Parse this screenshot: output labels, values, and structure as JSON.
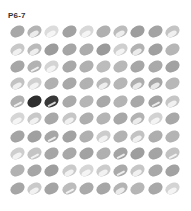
{
  "title": "P6-7",
  "grid": {
    "rows": 10,
    "cols": 10,
    "cells": [
      [
        "#a8a8a8",
        "#b4b4b4",
        "#dcdcdc",
        "#a2a2a2",
        "#d8d8d8",
        "#b0b0b0",
        "#bcbcbc",
        "#9e9e9e",
        "#a4a4a4",
        "#c4c4c4"
      ],
      [
        "#c8c8c8",
        "#bababa",
        "#9c9c9c",
        "#a6a6a6",
        "#acacac",
        "#9a9a9a",
        "#cfcfcf",
        "#b2b2b2",
        "#a0a0a0",
        "#b6b6b6"
      ],
      [
        "#a6a6a6",
        "#b2b2b2",
        "#d4d4d4",
        "#a8a8a8",
        "#b0b0b0",
        "#bcbcbc",
        "#b8b8b8",
        "#a6a6a6",
        "#aaaaaa",
        "#a2a2a2"
      ],
      [
        "#c2c2c2",
        "#d0d0d0",
        "#b0b0b0",
        "#a8a8a8",
        "#b2b2b2",
        "#bababa",
        "#b6b6b6",
        "#aeaeae",
        "#a6a6a6",
        "#b8b8b8"
      ],
      [
        "#b0b0b0",
        "#2e2e2e",
        "#383838",
        "#aaaaaa",
        "#b6b6b6",
        "#a8a8a8",
        "#b4b4b4",
        "#a8a8a8",
        "#a2a2a2",
        "#c6c6c6"
      ],
      [
        "#d6d6d6",
        "#c8c8c8",
        "#a8a8a8",
        "#c6c6c6",
        "#aeaeae",
        "#b4b4b4",
        "#a8a8a8",
        "#b2b2b2",
        "#d2d2d2",
        "#a8a8a8"
      ],
      [
        "#a4a4a4",
        "#a0a0a0",
        "#a6a6a6",
        "#a2a2a2",
        "#b0b0b0",
        "#cccccc",
        "#b2b2b2",
        "#c2c2c2",
        "#aeaeae",
        "#b4b4b4"
      ],
      [
        "#cecece",
        "#c4c4c4",
        "#a6a6a6",
        "#a8a8a8",
        "#a2a2a2",
        "#b0b0b0",
        "#a4a4a4",
        "#9e9e9e",
        "#a4a4a4",
        "#c2c2c2"
      ],
      [
        "#b2b2b2",
        "#a6a6a6",
        "#9e9e9e",
        "#cacaca",
        "#d6d6d6",
        "#cccccc",
        "#aaaaaa",
        "#c6c6c6",
        "#a8a8a8",
        "#a2a2a2"
      ],
      [
        "#a6a6a6",
        "#cacaca",
        "#a4a4a4",
        "#bcbcbc",
        "#aaaaaa",
        "#a6a6a6",
        "#b4b4b4",
        "#b6b6b6",
        "#a8a8a8",
        "#d4d4d4"
      ]
    ],
    "variants": [
      [
        "",
        "light",
        "light",
        "",
        "light",
        "",
        "light",
        "",
        "",
        "light"
      ],
      [
        "light",
        "light",
        "",
        "",
        "",
        "",
        "light",
        "light",
        "",
        ""
      ],
      [
        "",
        "streak",
        "light",
        "",
        "",
        "",
        "",
        "",
        "",
        ""
      ],
      [
        "light",
        "light",
        "",
        "",
        "",
        "light",
        "",
        "light",
        "light",
        ""
      ],
      [
        "streak",
        "",
        "streak",
        "",
        "",
        "",
        "",
        "",
        "streak",
        "light"
      ],
      [
        "light",
        "light",
        "",
        "light",
        "",
        "",
        "",
        "light",
        "light",
        ""
      ],
      [
        "",
        "",
        "streak",
        "",
        "",
        "light",
        "",
        "light",
        "",
        ""
      ],
      [
        "light",
        "streak",
        "",
        "",
        "",
        "",
        "streak",
        "",
        "",
        "streak"
      ],
      [
        "",
        "",
        "",
        "light",
        "light",
        "light",
        "streak",
        "light",
        "",
        ""
      ],
      [
        "",
        "light",
        "",
        "streak",
        "",
        "",
        "light",
        "",
        "",
        "light"
      ]
    ]
  }
}
